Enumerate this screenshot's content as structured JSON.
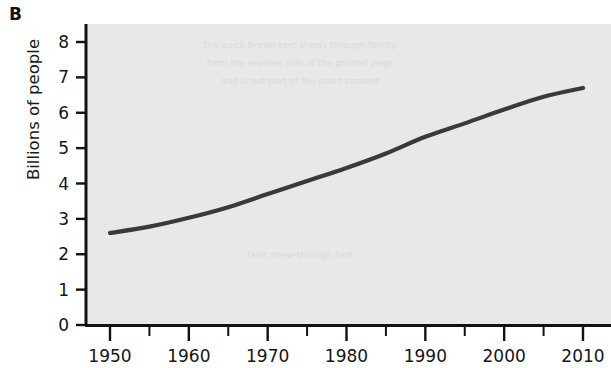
{
  "figure": {
    "panel_label": "B",
    "background_color": "#ffffff",
    "plot_background_color": "#e8e8e8",
    "axis_color": "#121212",
    "line_color": "#3a3a3a"
  },
  "chart_data": {
    "type": "line",
    "title": "",
    "subtitle": "",
    "xlabel": "",
    "ylabel": "Billions of people",
    "xlim": [
      1950,
      2012
    ],
    "ylim": [
      0,
      8.4
    ],
    "grid": false,
    "legend": null,
    "legend_position": "none",
    "x_tick_labels": [
      "1950",
      "1960",
      "1970",
      "1980",
      "1990",
      "2000",
      "2010"
    ],
    "x_ticks": [
      1950,
      1960,
      1970,
      1980,
      1990,
      2000,
      2010
    ],
    "x_minor_ticks": [
      1955,
      1965,
      1975,
      1985,
      1995,
      2005
    ],
    "y_tick_labels": [
      "0",
      "1",
      "2",
      "3",
      "4",
      "5",
      "6",
      "7",
      "8"
    ],
    "y_ticks": [
      0,
      1,
      2,
      3,
      4,
      5,
      6,
      7,
      8
    ],
    "series": [
      {
        "name": "World population",
        "x": [
          1950,
          1955,
          1960,
          1965,
          1970,
          1975,
          1980,
          1985,
          1990,
          1995,
          2000,
          2005,
          2010
        ],
        "values": [
          2.6,
          2.78,
          3.03,
          3.33,
          3.7,
          4.07,
          4.44,
          4.85,
          5.32,
          5.7,
          6.09,
          6.45,
          6.7
        ]
      }
    ],
    "annotations": []
  },
  "background_showthrough": {
    "note": "faint reverse-side print bleed",
    "lines": [
      "the quick brown text shows through faintly",
      "from the reverse side of the printed page",
      "and is not part of the chart content"
    ],
    "lower_line": "faint show-through text"
  }
}
